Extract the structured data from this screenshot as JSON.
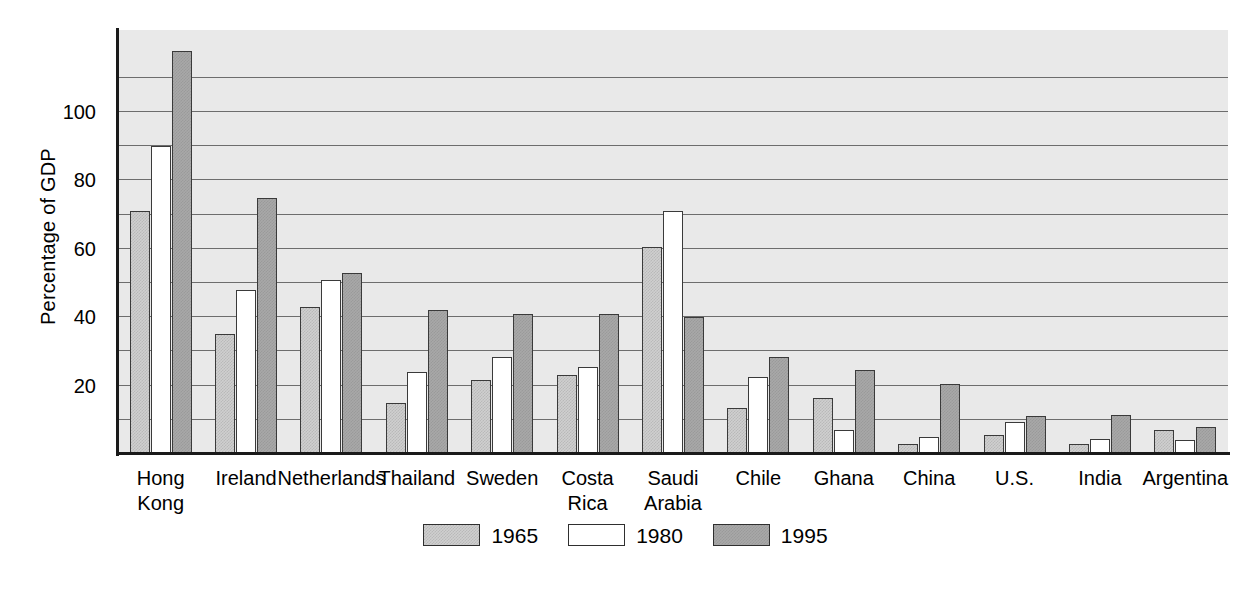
{
  "chart_data": {
    "type": "bar",
    "title": "",
    "xlabel": "",
    "ylabel": "Percentage of GDP",
    "ylim": [
      0,
      124
    ],
    "ytick_labels": [
      "20",
      "40",
      "60",
      "80",
      "100"
    ],
    "ytick_values": [
      20,
      40,
      60,
      80,
      100
    ],
    "gridlines": [
      10,
      20,
      30,
      40,
      50,
      60,
      70,
      80,
      90,
      100,
      110
    ],
    "grid": true,
    "legend_position": "bottom-center",
    "categories": [
      "Hong Kong",
      "Ireland",
      "Netherlands",
      "Thailand",
      "Sweden",
      "Costa Rica",
      "Saudi Arabia",
      "Chile",
      "Ghana",
      "China",
      "U.S.",
      "India",
      "Argentina"
    ],
    "category_lines": [
      [
        "Hong",
        "Kong"
      ],
      [
        "Ireland"
      ],
      [
        "Netherlands"
      ],
      [
        "Thailand"
      ],
      [
        "Sweden"
      ],
      [
        "Costa",
        "Rica"
      ],
      [
        "Saudi",
        "Arabia"
      ],
      [
        "Chile"
      ],
      [
        "Ghana"
      ],
      [
        "China"
      ],
      [
        "U.S."
      ],
      [
        "India"
      ],
      [
        "Argentina"
      ]
    ],
    "series": [
      {
        "name": "1965",
        "color": "#cfcfcf",
        "values": [
          71,
          35,
          43,
          15,
          21.5,
          23,
          60.5,
          13.5,
          16.5,
          3,
          5.5,
          3,
          7
        ]
      },
      {
        "name": "1980",
        "color": "#ffffff",
        "values": [
          90,
          48,
          51,
          24,
          28.5,
          25.5,
          71,
          22.5,
          7,
          5,
          9.5,
          4.5,
          4
        ]
      },
      {
        "name": "1995",
        "color": "#a8a8a8",
        "values": [
          118,
          75,
          53,
          42,
          41,
          41,
          40,
          28.5,
          24.5,
          20.5,
          11,
          11.5,
          8
        ]
      }
    ]
  },
  "legend": {
    "items": [
      {
        "label": "1965"
      },
      {
        "label": "1980"
      },
      {
        "label": "1995"
      }
    ]
  }
}
